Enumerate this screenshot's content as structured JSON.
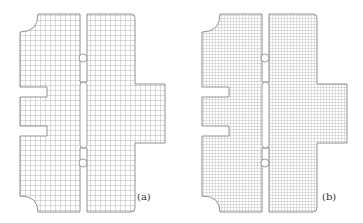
{
  "figure": {
    "panels": [
      {
        "id": "a",
        "label": "(a)",
        "mesh": "coarse quadrilateral mesh"
      },
      {
        "id": "b",
        "label": "(b)",
        "mesh": "refined quadrilateral mesh"
      }
    ]
  },
  "colors": {
    "mesh_line": "#8a8a8a",
    "background": "#ffffff"
  }
}
